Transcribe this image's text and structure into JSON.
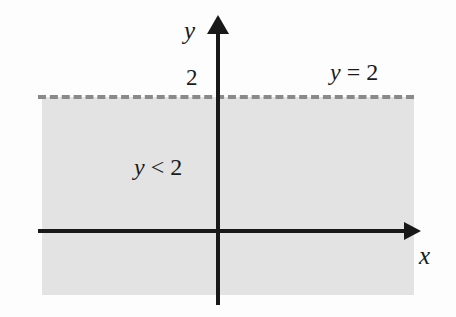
{
  "figure": {
    "background_color": "#fdfdfd"
  },
  "axes": {
    "y_axis_label": "y",
    "x_axis_label": "x",
    "axis_color": "#181818"
  },
  "ticks": {
    "y": [
      {
        "label": "2",
        "value": 2
      }
    ]
  },
  "annotations": {
    "boundary_line": {
      "variable": "y",
      "operator": "=",
      "value": "2",
      "text": "y = 2"
    },
    "region": {
      "variable": "y",
      "operator": "<",
      "value": "2",
      "text": "y < 2"
    }
  },
  "colors": {
    "shading": "#e3e3e3",
    "dashed_line": "#8a8a8a",
    "axis": "#181818",
    "text": "#1b1b1b"
  },
  "chart_data": {
    "type": "area",
    "title": "",
    "xlabel": "x",
    "ylabel": "y",
    "grid": false,
    "legend": "none",
    "xlim": [
      -5.1,
      5.4
    ],
    "ylim": [
      -2.1,
      3.0
    ],
    "boundary": {
      "label": "y = 2",
      "kind": "horizontal-line",
      "y": 2,
      "style": "dashed",
      "inclusive": false,
      "color": "#8a8a8a"
    },
    "regions": [
      {
        "label": "y < 2",
        "inequality": "y < 2",
        "shaded": true,
        "fill": "#e3e3e3",
        "side": "below",
        "y_range": [
          -2.1,
          2
        ]
      }
    ],
    "annotations": [
      {
        "text": "y = 2",
        "x": 3.1,
        "y": 2.35
      },
      {
        "text": "y < 2",
        "x": -1.9,
        "y": 0.85
      },
      {
        "text": "2",
        "x": -0.45,
        "y": 2.2
      }
    ]
  }
}
